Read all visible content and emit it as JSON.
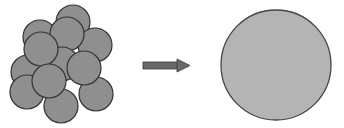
{
  "diagram": {
    "description": "Many small particles coalescing into one large particle",
    "colors": {
      "background": "#ffffff",
      "small_fill": "#8f8f8f",
      "small_stroke": "#333333",
      "large_fill": "#b4b4b4",
      "large_stroke": "#444444",
      "arrow_fill": "#6a6a6a",
      "arrow_stroke": "#3a3a3a"
    },
    "cluster": {
      "label": "cluster of small particles",
      "radius": 17,
      "circles": [
        {
          "cx": 73,
          "cy": 22
        },
        {
          "cx": 40,
          "cy": 37
        },
        {
          "cx": 95,
          "cy": 45
        },
        {
          "cx": 67,
          "cy": 34
        },
        {
          "cx": 28,
          "cy": 72
        },
        {
          "cx": 62,
          "cy": 64
        },
        {
          "cx": 41,
          "cy": 49
        },
        {
          "cx": 27,
          "cy": 92
        },
        {
          "cx": 96,
          "cy": 94
        },
        {
          "cx": 61,
          "cy": 106
        },
        {
          "cx": 84,
          "cy": 68
        },
        {
          "cx": 49,
          "cy": 81
        }
      ]
    },
    "arrow": {
      "label": "transforms into",
      "shaft": {
        "x": 143,
        "y": 62,
        "w": 36,
        "h": 7
      },
      "head": {
        "tip_x": 190,
        "base_x": 177,
        "top_y": 59,
        "bottom_y": 72
      }
    },
    "result": {
      "label": "single large particle",
      "cx": 276,
      "cy": 65,
      "r": 55
    }
  }
}
